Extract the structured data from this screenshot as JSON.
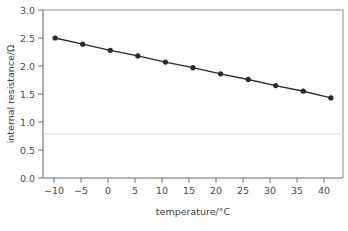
{
  "chart_data": {
    "type": "line",
    "title": "",
    "subtitle": "",
    "xlabel": "temperature/°C",
    "ylabel": "internal resistance/Ω",
    "x": [
      -10,
      -5,
      0,
      5,
      10,
      15,
      20,
      25,
      30,
      35,
      40
    ],
    "series": [
      {
        "name": "internal resistance",
        "values": [
          2.5,
          2.39,
          2.28,
          2.18,
          2.07,
          1.97,
          1.86,
          1.76,
          1.65,
          1.55,
          1.43
        ],
        "color": "#2b2b2b",
        "marker": "filled-circle"
      }
    ],
    "xlim": [
      -12.2,
      42.2
    ],
    "ylim": [
      0.0,
      3.0
    ],
    "xticks": [
      -10,
      -5,
      0,
      5,
      10,
      15,
      20,
      25,
      30,
      35,
      40
    ],
    "yticks": [
      0.0,
      0.5,
      1.0,
      1.5,
      2.0,
      2.5,
      3.0
    ],
    "xtick_labels": [
      "−10",
      "−5",
      "0",
      "5",
      "10",
      "15",
      "20",
      "25",
      "30",
      "35",
      "40"
    ],
    "ytick_labels": [
      "0.0",
      "0.5",
      "1.0",
      "1.5",
      "2.0",
      "2.5",
      "3.0"
    ],
    "grid": "single faint horizontal rule near 0.93",
    "gridlines_y": [
      0.93
    ],
    "legend": "none",
    "legend_position": "none",
    "frame": "top and right border rules drawn in light grey"
  },
  "axes": {
    "x_title": "temperature/°C",
    "y_title": "internal resistance/Ω"
  },
  "colors": {
    "series": "#2b2b2b",
    "axis": "#6e6e6e",
    "frame": "#8a8a8a",
    "grid": "#d8d8d8",
    "text": "#4a4a4a",
    "background": "#ffffff"
  }
}
